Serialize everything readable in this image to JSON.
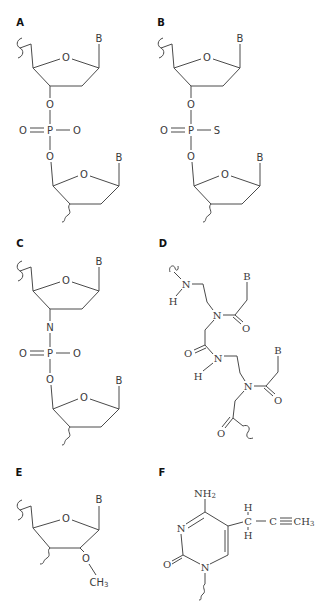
{
  "figure": {
    "panels": [
      {
        "id": "A",
        "label": "A",
        "description": "Phosphodiester linkage between two deoxyribose units",
        "atoms": {
          "base_top": "B",
          "ring_o_top": "O",
          "link_o_top": "O",
          "phosphorus": "P",
          "p_double_o": "O",
          "p_single_o": "O",
          "link_o_bottom": "O",
          "base_bottom": "B",
          "ring_o_bottom": "O"
        }
      },
      {
        "id": "B",
        "label": "B",
        "description": "Phosphorothioate linkage",
        "atoms": {
          "base_top": "B",
          "ring_o_top": "O",
          "link_o_top": "O",
          "phosphorus": "P",
          "p_double_o": "O",
          "p_single_s": "S",
          "link_o_bottom": "O",
          "base_bottom": "B",
          "ring_o_bottom": "O"
        }
      },
      {
        "id": "C",
        "label": "C",
        "description": "Phosphoramidate linkage",
        "atoms": {
          "base_top": "B",
          "ring_o_top": "O",
          "link_n": "N",
          "phosphorus": "P",
          "p_double_o": "O",
          "p_single_o": "O",
          "link_o_bottom": "O",
          "base_bottom": "B",
          "ring_o_bottom": "O"
        }
      },
      {
        "id": "D",
        "label": "D",
        "description": "Peptide nucleic acid (PNA) backbone",
        "atoms": {
          "n1": "N",
          "h1": "H",
          "n2": "N",
          "o1": "O",
          "base1": "B",
          "o2": "O",
          "n3": "N",
          "h3": "H",
          "n4": "N",
          "o3": "O",
          "base2": "B",
          "o4": "O"
        }
      },
      {
        "id": "E",
        "label": "E",
        "description": "2'-O-methyl ribose",
        "atoms": {
          "base": "B",
          "ring_o": "O",
          "o_methyl": "O",
          "methyl": "CH",
          "methyl_sub": "3"
        }
      },
      {
        "id": "F",
        "label": "F",
        "description": "C-5 propynyl cytosine",
        "atoms": {
          "amine": "NH",
          "amine_sub": "2",
          "n3": "N",
          "n1": "N",
          "carbonyl_o": "O",
          "ch2_c": "C",
          "ch2_h_top": "H",
          "ch2_h_bottom": "H",
          "alkyne_c": "C",
          "methyl": "CH",
          "methyl_sub": "3"
        }
      }
    ]
  }
}
